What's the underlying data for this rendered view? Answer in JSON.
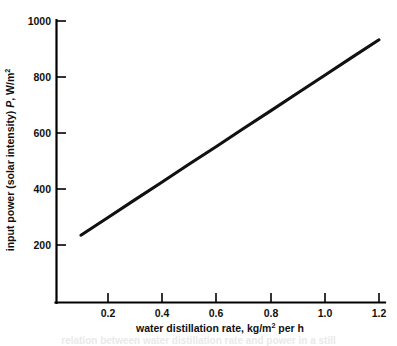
{
  "figure": {
    "background_color": "#ffffff",
    "line_color": "#111111",
    "axis_color": "#000000"
  },
  "chart_data": {
    "type": "line",
    "title": "",
    "subtitle": "",
    "xlabel": "water distillation rate, kg/m2 per h",
    "xlabel_main": "water distillation rate, kg/m",
    "xlabel_sup": "2",
    "xlabel_tail": " per h",
    "ylabel": "input power (solar intensity) P, W/m2",
    "ylabel_pre": "input power (solar intensity) ",
    "ylabel_italic": "P",
    "ylabel_mid": ", W/m",
    "ylabel_sup": "2",
    "xlim": [
      0.0,
      1.27
    ],
    "ylim": [
      0,
      1000
    ],
    "xticks": [
      0.2,
      0.4,
      0.6,
      0.8,
      1.0,
      1.2
    ],
    "xticklabels": [
      "0.2",
      "0.4",
      "0.6",
      "0.8",
      "1.0",
      "1.2"
    ],
    "yticks": [
      200,
      400,
      600,
      800,
      1000
    ],
    "yticklabels": [
      "200",
      "400",
      "600",
      "800",
      "1000"
    ],
    "grid": false,
    "legend": false,
    "legend_position": "none",
    "series": [
      {
        "name": "input power vs water distillation rate",
        "x": [
          0.1,
          0.2,
          0.3,
          0.4,
          0.5,
          0.6,
          0.7,
          0.8,
          0.9,
          1.0,
          1.1,
          1.2
        ],
        "y": [
          235,
          298,
          362,
          425,
          489,
          552,
          616,
          679,
          743,
          806,
          870,
          933
        ]
      }
    ],
    "annotations": []
  },
  "caption": {
    "ghost_text": "relation between water distillation rate and power in a still"
  }
}
